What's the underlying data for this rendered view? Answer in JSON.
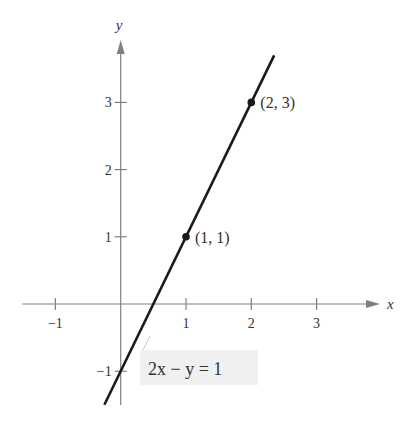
{
  "chart_data": {
    "type": "line",
    "title": "",
    "xlabel": "x",
    "ylabel": "y",
    "equation": "2x − y = 1",
    "line": {
      "slope": 2,
      "intercept": -1,
      "x_range": [
        -0.25,
        2.35
      ]
    },
    "points": [
      {
        "x": 1,
        "y": 1,
        "label": "(1,  1)"
      },
      {
        "x": 2,
        "y": 3,
        "label": "(2,  3)"
      }
    ],
    "x_ticks": [
      -1,
      1,
      2,
      3
    ],
    "x_tick_labels": [
      "−1",
      "1",
      "2",
      "3"
    ],
    "y_ticks": [
      -1,
      1,
      2,
      3
    ],
    "y_tick_labels": [
      "−1",
      "1",
      "2",
      "3"
    ],
    "xlim": [
      -1.6,
      3.8
    ],
    "ylim": [
      -1.5,
      3.9
    ],
    "grid": false,
    "legend": null
  },
  "style": {
    "axis_color": "#808080",
    "line_color": "#1a1a1a",
    "text_color": "#333333",
    "label_box_color": "#f0f0f0"
  }
}
